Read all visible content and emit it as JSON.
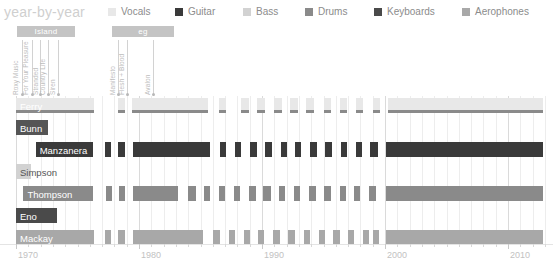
{
  "header": {
    "title": "year-by-year",
    "legend": [
      {
        "label": "Vocals",
        "color": "#e8e8e8",
        "x": 108
      },
      {
        "label": "Guitar",
        "color": "#3a3a3a",
        "x": 175
      },
      {
        "label": "Bass",
        "color": "#d2d2d2",
        "x": 243
      },
      {
        "label": "Drums",
        "color": "#8a8a8a",
        "x": 305
      },
      {
        "label": "Keyboards",
        "color": "#4a4a4a",
        "x": 374
      },
      {
        "label": "Aerophones",
        "color": "#a8a8a8",
        "x": 462
      }
    ]
  },
  "eras": [
    {
      "label": "Island",
      "x": 17,
      "y": 26,
      "width": 58,
      "color": "#c4c4c4"
    },
    {
      "label": "eg",
      "x": 112,
      "y": 26,
      "width": 62,
      "color": "#c4c4c4"
    }
  ],
  "albums": [
    {
      "title": "Roxy Music",
      "x": 22,
      "cap_x": 19,
      "cap_y": 88,
      "top": 40
    },
    {
      "title": "For Your Pleasure",
      "x": 32,
      "cap_x": 29,
      "cap_y": 88,
      "top": 40
    },
    {
      "title": "Stranded",
      "x": 40,
      "cap_x": 39,
      "cap_y": 88,
      "top": 40
    },
    {
      "title": "Country Life",
      "x": 48,
      "cap_x": 46,
      "cap_y": 88,
      "top": 40
    },
    {
      "title": "Siren",
      "x": 58,
      "cap_x": 56,
      "cap_y": 88,
      "top": 40
    },
    {
      "title": "Manifesto",
      "x": 118,
      "cap_x": 116,
      "cap_y": 88,
      "top": 40
    },
    {
      "title": "Flesh + Blood",
      "x": 127,
      "cap_x": 125,
      "cap_y": 88,
      "top": 40
    },
    {
      "title": "Avalon",
      "x": 153,
      "cap_x": 151,
      "cap_y": 88,
      "top": 40
    }
  ],
  "chart_data": {
    "type": "bar",
    "title": "year-by-year",
    "xlabel": "",
    "ylabel": "",
    "xlim": [
      1970,
      2013
    ],
    "grid": true,
    "legend_position": "top",
    "x_ticks_major": [
      1970,
      1980,
      1990,
      2000,
      2010
    ],
    "x_tick_labels": [
      "1970",
      "1980",
      "1990",
      "2000",
      "2010"
    ],
    "categories": [
      "Ferry",
      "Bunn",
      "Manzanera",
      "Simpson",
      "Thompson",
      "Eno",
      "Mackay"
    ],
    "series": [
      {
        "name": "Ferry",
        "instrument": "Vocals",
        "color": "#e8e8e8",
        "accent_color": "#8a8a8a",
        "label_inset": true,
        "spans": [
          {
            "from": 1970.0,
            "to": 1976.3
          },
          {
            "from": 1978.3,
            "to": 1978.9
          },
          {
            "from": 1979.4,
            "to": 1985.6
          },
          {
            "from": 1986.5,
            "to": 1987.1
          },
          {
            "from": 1988.3,
            "to": 1988.9
          },
          {
            "from": 1989.6,
            "to": 1990.2
          },
          {
            "from": 1991.0,
            "to": 1991.6
          },
          {
            "from": 1992.3,
            "to": 1992.9
          },
          {
            "from": 1993.6,
            "to": 1994.2
          },
          {
            "from": 1995.0,
            "to": 1995.6
          },
          {
            "from": 1996.3,
            "to": 1996.9
          },
          {
            "from": 1997.6,
            "to": 1998.2
          },
          {
            "from": 1999.0,
            "to": 1999.6
          },
          {
            "from": 2000.2,
            "to": 2012.8
          }
        ]
      },
      {
        "name": "Bunn",
        "instrument": "Guitar",
        "color": "#555555",
        "label_inset": true,
        "spans": [
          {
            "from": 1970.0,
            "to": 1972.6
          }
        ]
      },
      {
        "name": "Manzanera",
        "instrument": "Guitar",
        "color": "#3a3a3a",
        "label_inset": true,
        "spans": [
          {
            "from": 1971.6,
            "to": 1976.3
          },
          {
            "from": 1977.2,
            "to": 1977.7
          },
          {
            "from": 1978.3,
            "to": 1978.9
          },
          {
            "from": 1979.5,
            "to": 1985.8
          },
          {
            "from": 1986.6,
            "to": 1987.1
          },
          {
            "from": 1987.8,
            "to": 1988.3
          },
          {
            "from": 1989.0,
            "to": 1989.6
          },
          {
            "from": 1990.2,
            "to": 1990.8
          },
          {
            "from": 1991.5,
            "to": 1992.0
          },
          {
            "from": 1992.7,
            "to": 1993.2
          },
          {
            "from": 1993.9,
            "to": 1994.5
          },
          {
            "from": 1995.1,
            "to": 1995.7
          },
          {
            "from": 1996.4,
            "to": 1996.9
          },
          {
            "from": 1997.6,
            "to": 1998.1
          },
          {
            "from": 1998.8,
            "to": 1999.4
          },
          {
            "from": 2000.1,
            "to": 2012.8
          }
        ]
      },
      {
        "name": "Simpson",
        "instrument": "Bass",
        "color": "#d2d2d2",
        "label_inset": false,
        "spans": [
          {
            "from": 1970.0,
            "to": 1971.2
          }
        ]
      },
      {
        "name": "Thompson",
        "instrument": "Drums",
        "color": "#8a8a8a",
        "label_inset": true,
        "spans": [
          {
            "from": 1970.6,
            "to": 1976.3
          },
          {
            "from": 1977.3,
            "to": 1977.8
          },
          {
            "from": 1978.4,
            "to": 1978.9
          },
          {
            "from": 1979.5,
            "to": 1983.2
          },
          {
            "from": 1984.0,
            "to": 1984.6
          },
          {
            "from": 1985.3,
            "to": 1985.8
          },
          {
            "from": 1986.5,
            "to": 1987.0
          },
          {
            "from": 1987.7,
            "to": 1988.2
          },
          {
            "from": 1988.9,
            "to": 1989.5
          },
          {
            "from": 1990.1,
            "to": 1990.7
          },
          {
            "from": 1991.4,
            "to": 1991.9
          },
          {
            "from": 1992.6,
            "to": 1993.1
          },
          {
            "from": 1993.8,
            "to": 1994.4
          },
          {
            "from": 1995.0,
            "to": 1995.6
          },
          {
            "from": 1996.3,
            "to": 1996.8
          },
          {
            "from": 1997.5,
            "to": 1998.0
          },
          {
            "from": 1998.7,
            "to": 1999.3
          },
          {
            "from": 2000.1,
            "to": 2012.8
          }
        ]
      },
      {
        "name": "Eno",
        "instrument": "Keyboards",
        "color": "#4a4a4a",
        "label_inset": true,
        "spans": [
          {
            "from": 1970.0,
            "to": 1973.3
          }
        ]
      },
      {
        "name": "Mackay",
        "instrument": "Aerophones",
        "color": "#a8a8a8",
        "label_inset": true,
        "spans": [
          {
            "from": 1970.0,
            "to": 1976.3
          },
          {
            "from": 1977.2,
            "to": 1977.7
          },
          {
            "from": 1978.3,
            "to": 1978.9
          },
          {
            "from": 1979.5,
            "to": 1985.2
          },
          {
            "from": 1986.0,
            "to": 1986.6
          },
          {
            "from": 1987.3,
            "to": 1987.8
          },
          {
            "from": 1988.5,
            "to": 1989.0
          },
          {
            "from": 1989.7,
            "to": 1990.2
          },
          {
            "from": 1990.9,
            "to": 1991.5
          },
          {
            "from": 1992.1,
            "to": 1992.7
          },
          {
            "from": 1993.4,
            "to": 1993.9
          },
          {
            "from": 1994.6,
            "to": 1995.1
          },
          {
            "from": 1995.8,
            "to": 1996.3
          },
          {
            "from": 1997.0,
            "to": 1997.5
          },
          {
            "from": 1998.2,
            "to": 1998.7
          },
          {
            "from": 1999.0,
            "to": 1999.5
          },
          {
            "from": 2000.1,
            "to": 2012.8
          }
        ]
      }
    ]
  }
}
